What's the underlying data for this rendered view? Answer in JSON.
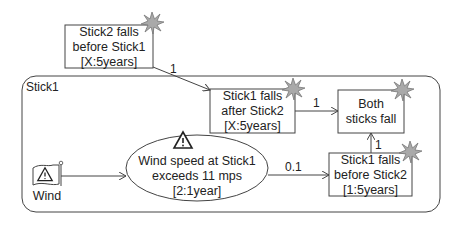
{
  "diagram": {
    "container": {
      "label": "Stick1"
    },
    "nodes": [
      {
        "id": "stick2-before-stick1",
        "lines": [
          "Stick2 falls",
          "before Stick1",
          "[X:5years]"
        ],
        "shape": "box",
        "marker": "burst-icon"
      },
      {
        "id": "stick1-after-stick2",
        "lines": [
          "Stick1 falls",
          "after Stick2",
          "[X:5years]"
        ],
        "shape": "box",
        "marker": "burst-icon"
      },
      {
        "id": "both-sticks-fall",
        "lines": [
          "Both",
          "sticks fall"
        ],
        "shape": "box",
        "marker": "burst-icon"
      },
      {
        "id": "stick1-before-stick2",
        "lines": [
          "Stick1 falls",
          "before Stick2",
          "[1:5years]"
        ],
        "shape": "box",
        "marker": "burst-icon"
      },
      {
        "id": "wind-speed",
        "lines": [
          "Wind speed at Stick1",
          "exceeds 11 mps",
          "[2:1year]"
        ],
        "shape": "ellipse",
        "marker": "warning-icon"
      },
      {
        "id": "wind",
        "lines": [
          "Wind"
        ],
        "shape": "flag",
        "marker": "warning-icon"
      }
    ],
    "edges": [
      {
        "from": "stick2-before-stick1",
        "to": "stick1-after-stick2",
        "label": "1"
      },
      {
        "from": "stick1-after-stick2",
        "to": "both-sticks-fall",
        "label": "1"
      },
      {
        "from": "stick1-before-stick2",
        "to": "both-sticks-fall",
        "label": "1"
      },
      {
        "from": "wind-speed",
        "to": "stick1-before-stick2",
        "label": "0.1"
      },
      {
        "from": "wind",
        "to": "wind-speed",
        "label": ""
      }
    ],
    "colors": {
      "line": "#444444",
      "burst": "#a9a9a9",
      "burst_stroke": "#666666"
    }
  }
}
